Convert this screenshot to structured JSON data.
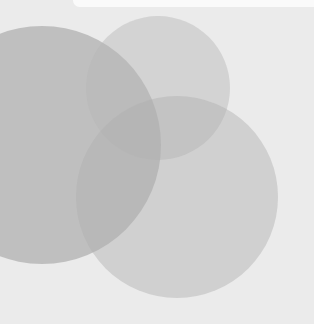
{
  "artwork": {
    "background_color": "#ebebeb",
    "top_bar_color": "#fafafa",
    "circles": [
      {
        "name": "large-left-circle",
        "cx": 42,
        "cy": 145,
        "r": 119,
        "color": "#9a9a9a",
        "opacity": 0.55
      },
      {
        "name": "top-middle-circle",
        "cx": 158,
        "cy": 88,
        "r": 72,
        "color": "#b5b5b5",
        "opacity": 0.45
      },
      {
        "name": "bottom-right-circle",
        "cx": 177,
        "cy": 197,
        "r": 101,
        "color": "#b0b0b0",
        "opacity": 0.45
      }
    ]
  }
}
